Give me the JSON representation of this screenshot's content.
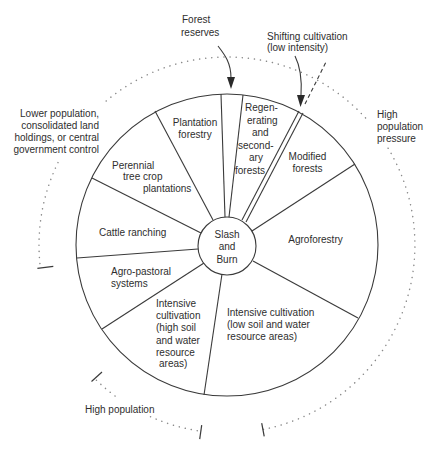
{
  "center": {
    "lines": [
      "Slash",
      "and",
      "Burn"
    ]
  },
  "sectors": [
    {
      "name": "Plantation forestry",
      "lines": [
        "Plantation",
        "forestry"
      ]
    },
    {
      "name": "Regenerating and secondary forests",
      "lines": [
        "Regen-",
        "erating",
        "and",
        "second-",
        "ary",
        "forests"
      ]
    },
    {
      "name": "Modified forests",
      "lines": [
        "Modified",
        "forests"
      ]
    },
    {
      "name": "Agroforestry",
      "lines": [
        "Agroforestry"
      ]
    },
    {
      "name": "Intensive cultivation (low soil and water resource areas)",
      "lines": [
        "Intensive cultivation",
        "(low soil and water",
        "resource areas)"
      ]
    },
    {
      "name": "Intensive cultivation (high soil and water resource areas)",
      "lines": [
        "Intensive",
        "cultivation",
        "(high soil",
        "and water",
        "resource",
        "areas)"
      ]
    },
    {
      "name": "Agro-pastoral systems",
      "lines": [
        "Agro-pastoral",
        "systems"
      ]
    },
    {
      "name": "Cattle ranching",
      "lines": [
        "Cattle ranching"
      ]
    },
    {
      "name": "Perennial tree crop plantations",
      "lines": [
        "Perennial",
        "tree crop",
        "plantations"
      ]
    }
  ],
  "callouts": {
    "forest_reserves": {
      "lines": [
        "Forest",
        "reserves"
      ]
    },
    "shifting_cultivation": {
      "lines": [
        "Shifting cultivation",
        "(low intensity)"
      ]
    }
  },
  "pressure_labels": {
    "high_population_pressure": {
      "lines": [
        "High",
        "population",
        "pressure"
      ]
    },
    "lower_population": {
      "lines": [
        "Lower population,",
        "consolidated land",
        "holdings, or central",
        "government control"
      ]
    },
    "high_population": {
      "lines": [
        "High population"
      ]
    }
  },
  "colors": {
    "line": "#3a3a3a",
    "dotted_arc": "#8a8a8a",
    "text": "#2e2e2e",
    "background": "#ffffff"
  }
}
